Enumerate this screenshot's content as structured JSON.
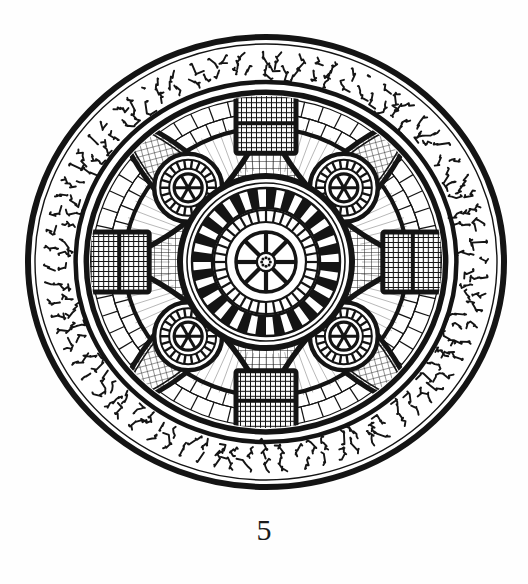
{
  "document": {
    "kind": "scanned-figure-plate",
    "background_color": "#fefefe",
    "ink_color": "#141414",
    "figure_caption": "5",
    "figure_title": "",
    "alt_description": "Circular ornamental medallion with pseudo-Kufic inscription border, mosaic tessellation, central radiate rosette and four satellite rosettes in lens-shaped compartments"
  },
  "figure": {
    "center": {
      "x": 266,
      "y": 262
    },
    "ellipse": {
      "rx": 238,
      "ry": 225
    },
    "rim": {
      "label": "outer-rim",
      "stroke_width": 6,
      "color": "#141414"
    },
    "inscription_band": {
      "label": "pseudo-kufic-inscription-band",
      "outer_scale": 0.975,
      "inner_scale": 0.8,
      "glyph_count": 150,
      "glyph_set": [
        "ʅ",
        "ʃ",
        "Ƨ",
        "ʒ",
        "ʓ",
        "ʅ",
        "ᴝ",
        "ƪ",
        "ɹ",
        "Ƨ",
        "ʯ",
        "ʡ",
        "ʖ",
        "ʗ",
        "ᴢ",
        "ʞ",
        "Ɛ",
        "ʑ",
        "ʎ",
        "ƺ"
      ],
      "description": "ornamental illegible script, two concentric lines of glyphs"
    },
    "inner_ring": {
      "label": "mosaic-ring",
      "outer_scale": 0.775,
      "inner_scale": 0.735,
      "stroke_width": 5
    },
    "mosaic_field": {
      "label": "tessellated-mosaic-field",
      "outer_scale": 0.73,
      "tile_rings": 9,
      "tiles_per_ring": 56,
      "tile_stroke": 1.1
    },
    "cross_arms": {
      "label": "cardinal-dark-arms",
      "count": 4,
      "angles_deg": [
        0,
        90,
        180,
        270
      ],
      "fill": "fine-hatch-dark"
    },
    "central_medallion": {
      "label": "central-rosette",
      "outer_radius": 86,
      "ray_ring": {
        "outer": 74,
        "inner": 54,
        "count": 24
      },
      "tick_ring": {
        "outer": 52,
        "inner": 40,
        "count": 36
      },
      "hub": {
        "radius": 30,
        "spokes": 8
      },
      "pip": {
        "radius": 7,
        "petals": 8
      }
    },
    "satellite_rosettes": {
      "label": "satellite-rosette",
      "count": 4,
      "angles_deg": [
        45,
        135,
        225,
        315
      ],
      "orbit_radius": 128,
      "outer_radius": 34,
      "ray_ring": {
        "outer": 28,
        "inner": 19,
        "count": 22
      },
      "hub": {
        "radius": 14,
        "spokes": 6
      }
    },
    "lens_compartments": {
      "label": "lens-compartment",
      "count": 4,
      "angles_deg": [
        45,
        135,
        225,
        315
      ],
      "fill": "fine-mesh"
    }
  },
  "palette": {
    "ink": "#141414",
    "ink_soft": "#2a2a2a",
    "paper": "#fefefe",
    "paper_shade": "#f4f4f1"
  }
}
